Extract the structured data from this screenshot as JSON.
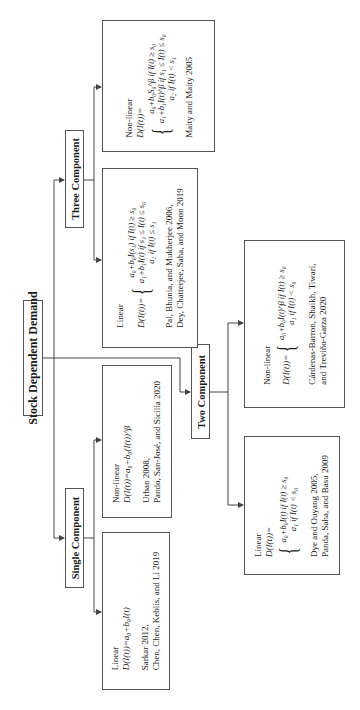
{
  "diagram": {
    "root": {
      "label": "Stock Dependent Demand"
    },
    "categories": [
      {
        "label": "Single Component",
        "children": [
          {
            "type": "Linear",
            "equation": "D(I(t))=a₀+b₀I(t)",
            "references": [
              "Sarkar 2012,",
              "Chen, Chen, Keblis, and Li 2019"
            ]
          },
          {
            "type": "Non-linear",
            "equation": "D(I(t))=a₀+b₀(I(t))^β",
            "references": [
              "Urban 2008,",
              "Pando, San-José, and Sicilia 2020"
            ]
          }
        ]
      },
      {
        "label": "Two Component",
        "children": [
          {
            "type": "Linear",
            "equation_lhs": "D(I(t))=",
            "cases": [
              "a₀+b₀I(t) if I(t) ≥ s₀",
              "a₁ if I(t) < s₀"
            ],
            "references": [
              "Dye and Ouyang 2005,",
              "Panda, Saha, and Basu 2009"
            ]
          },
          {
            "type": "Non-linear",
            "equation_lhs": "D(I(t))=",
            "cases": [
              "a₀+b₀I(t)^β if I(t) ≥ s₀",
              "a₁ if I(t) < s₀"
            ],
            "references": [
              "Cárdenas-Barron, Shaikh, Tiwari,",
              "and Treviño-Garza 2020"
            ]
          }
        ]
      },
      {
        "label": "Three Component",
        "children": [
          {
            "type": "Linear",
            "equation_lhs": "D(I(t))=",
            "cases": [
              "a₀+b₀I(s₁) if I(t) ≥ s₀",
              "a₁+b₁I(t) if s₁ ≤ I(t) ≤ s₀",
              "a₂ if I(t) ≤ s₁"
            ],
            "references": [
              "Pal, Bhunia, and Mukherjee 2006,",
              "Dey, Chatterjee, Saha, and Moon 2019"
            ]
          },
          {
            "type": "Non-linear",
            "equation_lhs": "D(I(t))=",
            "cases": [
              "a₀+b₀S₀^β if I(t) ≥ s₀",
              "a₁+b₁I(t)^β if s₁ ≤ I(t) ≤ s₀",
              "a₂ if I(t) < s₁"
            ],
            "references": [
              "Maity and Maity 2005"
            ]
          }
        ]
      }
    ]
  },
  "colors": {
    "line": "#444444",
    "border": "#555555",
    "text": "#1a1a1a",
    "background": "#ffffff"
  }
}
